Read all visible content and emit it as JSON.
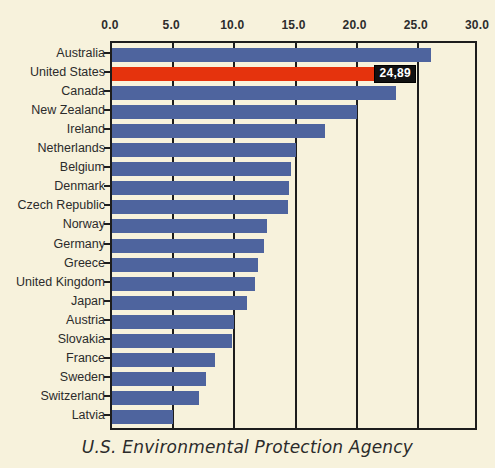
{
  "caption": "U.S. Environmental Protection Agency",
  "chart_data": {
    "type": "bar",
    "orientation": "horizontal",
    "title": "",
    "subtitle": "",
    "xlabel": "",
    "ylabel": "",
    "xlim": [
      0.0,
      30.0
    ],
    "xticks": [
      "0.0",
      "5.0",
      "10.0",
      "15.0",
      "20.0",
      "25.0",
      "30.0"
    ],
    "xtick_values": [
      0.0,
      5.0,
      10.0,
      15.0,
      20.0,
      25.0,
      30.0
    ],
    "grid": true,
    "grid_axis": "x",
    "legend": "none",
    "categories": [
      "Australia",
      "United States",
      "Canada",
      "New Zealand",
      "Ireland",
      "Netherlands",
      "Belgium",
      "Denmark",
      "Czech Republic",
      "Norway",
      "Germany",
      "Greece",
      "United Kingdom",
      "Japan",
      "Austria",
      "Slovakia",
      "France",
      "Sweden",
      "Switzerland",
      "Latvia"
    ],
    "values": [
      26.1,
      24.89,
      23.2,
      20.0,
      17.4,
      15.0,
      14.6,
      14.5,
      14.4,
      12.7,
      12.4,
      11.9,
      11.7,
      11.0,
      10.0,
      9.8,
      8.4,
      7.7,
      7.1,
      5.0
    ],
    "highlight_category": "United States",
    "annotations": [
      {
        "category": "United States",
        "text": "24,89",
        "value": 24.89
      }
    ],
    "colors": {
      "bar": "#4e649e",
      "highlight_bar": "#e5330d",
      "background": "#f7f2dc",
      "axis": "#1d1d1d",
      "text": "#2b2b2b",
      "callout_background": "#111111",
      "callout_text": "#ffffff"
    }
  }
}
